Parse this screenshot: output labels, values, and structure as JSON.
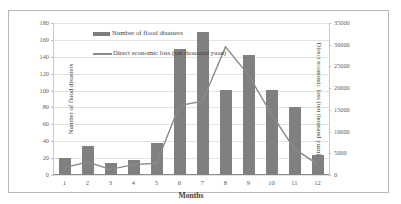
{
  "chart_data": {
    "type": "bar",
    "title": "",
    "categories": [
      "1",
      "2",
      "3",
      "4",
      "5",
      "6",
      "7",
      "8",
      "9",
      "10",
      "11",
      "12"
    ],
    "xlabel": "Months",
    "grid": true,
    "legend_position": "top-center",
    "axes": {
      "left": {
        "label": "Number of flood disasters",
        "ticks": [
          0,
          20,
          40,
          60,
          80,
          100,
          120,
          140,
          160,
          180
        ],
        "ylim": [
          0,
          180
        ]
      },
      "right": {
        "label": "Direct economic loss (ten thousand yuan)",
        "ticks": [
          0,
          5000,
          10000,
          15000,
          20000,
          25000,
          30000,
          35000
        ],
        "ylim": [
          0,
          35000
        ]
      }
    },
    "series": [
      {
        "name": "Number of flood disasters",
        "type": "bar",
        "axis": "left",
        "color": "#808080",
        "values": [
          20,
          34,
          14,
          18,
          38,
          149,
          169,
          101,
          142,
          101,
          80,
          24
        ]
      },
      {
        "name": "Direct economic loss (ten thousand yuan)",
        "type": "line",
        "axis": "right",
        "color": "#8a8a8a",
        "values": [
          1700,
          3000,
          1300,
          2400,
          2700,
          16000,
          17000,
          29500,
          23000,
          14000,
          6000,
          2500
        ]
      }
    ]
  },
  "legend": {
    "items": [
      {
        "label": "Number of flood disasters",
        "marker": "bar-swatch"
      },
      {
        "label": "Direct economic loss (ten thousand yuan)",
        "marker": "line-swatch"
      }
    ]
  },
  "colors": {
    "bar": "#808080",
    "line": "#8a8a8a",
    "grid": "#e2e2e2",
    "frame": "#b9b9b9",
    "text": "#4a4a4a"
  }
}
